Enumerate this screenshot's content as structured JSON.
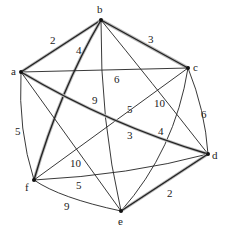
{
  "graph": {
    "nodes": [
      {
        "id": "a",
        "label": "a",
        "x": 21,
        "y": 72,
        "lx": 11,
        "ly": 75
      },
      {
        "id": "b",
        "label": "b",
        "x": 101,
        "y": 20,
        "lx": 97,
        "ly": 13
      },
      {
        "id": "c",
        "label": "c",
        "x": 188,
        "y": 68,
        "lx": 193,
        "ly": 71
      },
      {
        "id": "d",
        "label": "d",
        "x": 208,
        "y": 154,
        "lx": 212,
        "ly": 159
      },
      {
        "id": "e",
        "label": "e",
        "x": 121,
        "y": 211,
        "lx": 118,
        "ly": 225
      },
      {
        "id": "f",
        "label": "f",
        "x": 34,
        "y": 180,
        "lx": 25,
        "ly": 191
      }
    ],
    "edges": [
      {
        "from": "a",
        "to": "b",
        "weight": "2",
        "bold": true,
        "path": "M21,72 L101,20",
        "lx": 50,
        "ly": 44
      },
      {
        "from": "b",
        "to": "c",
        "weight": "3",
        "bold": true,
        "path": "M101,20 L188,68",
        "lx": 148,
        "ly": 43
      },
      {
        "from": "b",
        "to": "f",
        "weight": "4",
        "bold": true,
        "path": "M101,20 Q60,90 34,180",
        "lx": 76,
        "ly": 54
      },
      {
        "from": "a",
        "to": "c",
        "weight": "6",
        "bold": false,
        "path": "M21,72 L188,68",
        "lx": 114,
        "ly": 83
      },
      {
        "from": "b",
        "to": "e",
        "weight": "9",
        "bold": false,
        "path": "M101,20 Q100,120 121,211",
        "lx": 92,
        "ly": 104
      },
      {
        "from": "b",
        "to": "d",
        "weight": "10",
        "bold": false,
        "path": "M101,20 Q150,80 208,154",
        "lx": 154,
        "ly": 107
      },
      {
        "from": "c",
        "to": "f",
        "weight": "5",
        "bold": false,
        "path": "M188,68 L34,180",
        "lx": 127,
        "ly": 113
      },
      {
        "from": "c",
        "to": "e",
        "weight": "4",
        "bold": false,
        "path": "M188,68 Q175,150 121,211",
        "lx": 158,
        "ly": 135
      },
      {
        "from": "a",
        "to": "d",
        "weight": "3",
        "bold": true,
        "path": "M21,72 Q110,125 208,154",
        "lx": 127,
        "ly": 139
      },
      {
        "from": "c",
        "to": "d",
        "weight": "6",
        "bold": false,
        "path": "M188,68 Q205,110 208,154",
        "lx": 201,
        "ly": 118
      },
      {
        "from": "a",
        "to": "f",
        "weight": "5",
        "bold": false,
        "path": "M21,72 Q18,130 34,180",
        "lx": 15,
        "ly": 135
      },
      {
        "from": "a",
        "to": "e",
        "weight": "10",
        "bold": false,
        "path": "M21,72 L121,211",
        "lx": 70,
        "ly": 167
      },
      {
        "from": "f",
        "to": "d",
        "weight": "5",
        "bold": false,
        "path": "M34,180 Q130,175 208,154",
        "lx": 76,
        "ly": 189
      },
      {
        "from": "f",
        "to": "e",
        "weight": "9",
        "bold": false,
        "path": "M34,180 Q60,198 121,211",
        "lx": 64,
        "ly": 210
      },
      {
        "from": "e",
        "to": "d",
        "weight": "2",
        "bold": true,
        "path": "M121,211 L208,154",
        "lx": 167,
        "ly": 197
      }
    ]
  }
}
